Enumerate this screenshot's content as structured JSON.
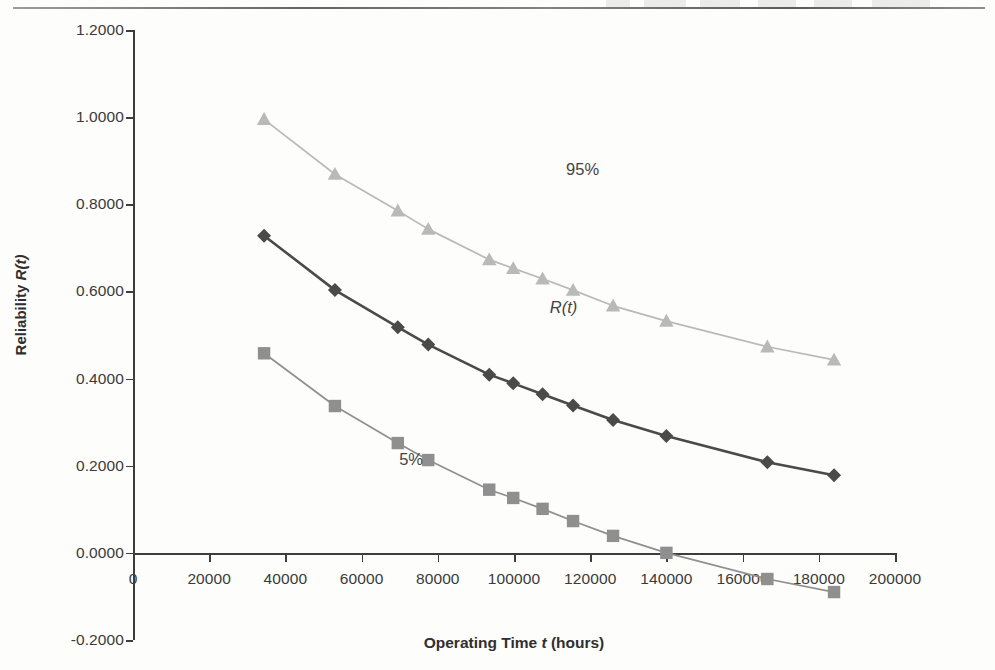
{
  "page": {
    "background": "#fdfdfc",
    "top_rule": "horizontal-rule"
  },
  "axes": {
    "y_title_plain": "Reliability ",
    "y_title_math": "R(t)",
    "x_title_plain_1": "Operating Time ",
    "x_title_math": "t",
    "x_title_plain_2": " (hours)",
    "y_ticks": [
      "1.2000",
      "1.0000",
      "0.8000",
      "0.6000",
      "0.4000",
      "0.2000",
      "0.0000",
      "-0.2000"
    ],
    "y_tick_values": [
      1.2,
      1.0,
      0.8,
      0.6,
      0.4,
      0.2,
      0.0,
      -0.2
    ],
    "x_ticks": [
      "0",
      "20000",
      "40000",
      "60000",
      "80000",
      "100000",
      "120000",
      "140000",
      "160000",
      "180000",
      "200000"
    ],
    "x_tick_values": [
      0,
      20000,
      40000,
      60000,
      80000,
      100000,
      120000,
      140000,
      160000,
      180000,
      200000
    ],
    "ylim": [
      -0.2,
      1.2
    ],
    "xlim": [
      0,
      200000
    ],
    "grid": "off"
  },
  "labels": {
    "upper": "95%",
    "middle": "R(t)",
    "lower": "5%"
  },
  "colors": {
    "upper_series": "#b9b9b9",
    "middle_series": "#4a4a4a",
    "lower_series": "#8f8f8f",
    "axis": "#3d3d3d",
    "text": "#3a3a3a"
  },
  "chart_data": {
    "type": "line",
    "title": "",
    "subtitle": "",
    "xlabel": "Operating Time t (hours)",
    "ylabel": "Reliability R(t)",
    "xlim": [
      0,
      200000
    ],
    "ylim": [
      -0.2,
      1.2
    ],
    "grid": false,
    "legend_position": "inline-annotations",
    "annotations": [
      {
        "text": "95%",
        "x": 118000,
        "y": 0.88,
        "series": "95% upper confidence bound"
      },
      {
        "text": "R(t)",
        "x": 113000,
        "y": 0.565,
        "series": "R(t) point estimate"
      },
      {
        "text": "5%",
        "x": 73000,
        "y": 0.215,
        "series": "5% lower confidence bound"
      }
    ],
    "x": [
      34400,
      53000,
      69500,
      77500,
      93500,
      99800,
      107500,
      115500,
      126000,
      140000,
      166500,
      184000
    ],
    "series": [
      {
        "name": "95%",
        "marker": "triangle",
        "color": "#b9b9b9",
        "values": [
          0.995,
          0.869,
          0.785,
          0.743,
          0.673,
          0.653,
          0.629,
          0.603,
          0.567,
          0.532,
          0.473,
          0.443
        ]
      },
      {
        "name": "R(t)",
        "marker": "diamond",
        "color": "#4a4a4a",
        "values": [
          0.728,
          0.603,
          0.518,
          0.478,
          0.409,
          0.389,
          0.364,
          0.338,
          0.305,
          0.268,
          0.208,
          0.178
        ]
      },
      {
        "name": "5%",
        "marker": "square",
        "color": "#8f8f8f",
        "values": [
          0.458,
          0.337,
          0.252,
          0.213,
          0.145,
          0.126,
          0.101,
          0.073,
          0.039,
          0.0,
          -0.06,
          -0.09
        ]
      }
    ]
  }
}
